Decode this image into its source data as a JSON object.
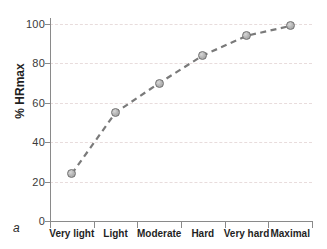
{
  "figure": {
    "panel_label": "a"
  },
  "chart_data": {
    "type": "line",
    "title": "",
    "xlabel": "",
    "ylabel": "% HRmax",
    "categories": [
      "Very light",
      "Light",
      "Moderate",
      "Hard",
      "Very hard",
      "Maximal"
    ],
    "values": [
      24,
      55,
      70,
      84,
      94,
      99
    ],
    "series": [
      {
        "name": "% HRmax",
        "values": [
          24,
          55,
          70,
          84,
          94,
          99
        ]
      }
    ],
    "ylim": [
      0,
      100
    ],
    "yticks": [
      0,
      20,
      40,
      60,
      80,
      100
    ],
    "ytick_labels": [
      "0",
      "20",
      "40",
      "60",
      "80",
      "100"
    ],
    "grid": "horizontal-dashed",
    "legend": "none",
    "line_style": "dashed",
    "marker": "circle",
    "colors": {
      "line": "#7a7a7a",
      "marker_fill": "#b6b6b6",
      "marker_edge": "#6f6f6f",
      "gridline": "#e8dcdc",
      "axis": "#8a8a8a",
      "text": "#1f1f1f",
      "background": "#ffffff"
    }
  }
}
